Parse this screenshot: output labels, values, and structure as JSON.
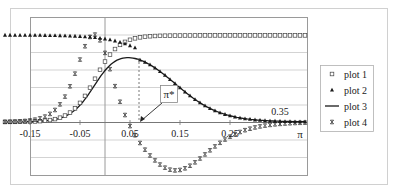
{
  "chart_data": {
    "type": "scatter",
    "title": "",
    "xlabel": "π",
    "ylabel": "",
    "xlim": [
      -0.2,
      0.4
    ],
    "ylim": [
      -0.6,
      1.2
    ],
    "grid": {
      "horizontal": true,
      "vertical": false
    },
    "legend_position": "right",
    "x_tick_labels": [
      {
        "value": -0.15,
        "label": "-0.15"
      },
      {
        "value": -0.05,
        "label": "-0.05"
      },
      {
        "value": 0.05,
        "label": "0.05"
      },
      {
        "value": 0.15,
        "label": "0.15"
      },
      {
        "value": 0.25,
        "label": "0.25"
      },
      {
        "value": 0.35,
        "label": "0.35"
      }
    ],
    "axis_end_label": "π",
    "annotation": {
      "label": "π*",
      "x": 0.068,
      "y": 0.0,
      "dashed_line_top_y": 0.74
    },
    "series": [
      {
        "name": "plot 1",
        "marker": "square-open",
        "description": "logistic rising from 0 (~-0.2) to 1 (~0.1), flat at 1 thereafter",
        "x": [
          -0.2,
          -0.15,
          -0.1,
          -0.05,
          0,
          0.02,
          0.04,
          0.06,
          0.08,
          0.1,
          0.15,
          0.2,
          0.3,
          0.4
        ],
        "values": [
          0.0,
          0.02,
          0.08,
          0.25,
          0.55,
          0.7,
          0.82,
          0.92,
          0.97,
          0.99,
          1.0,
          1.0,
          1.0,
          1.0
        ]
      },
      {
        "name": "plot 2",
        "marker": "triangle-filled",
        "description": "flat at 1 then declining to 0 near 0.4",
        "x": [
          -0.2,
          -0.1,
          0,
          0.04,
          0.07,
          0.1,
          0.15,
          0.2,
          0.25,
          0.3,
          0.35,
          0.4
        ],
        "values": [
          1.0,
          0.99,
          0.95,
          0.86,
          0.74,
          0.64,
          0.45,
          0.26,
          0.12,
          0.05,
          0.02,
          0.01
        ]
      },
      {
        "name": "plot 3",
        "marker": "line",
        "description": "bell curve peaking ~0.74 at π*≈0.068",
        "x": [
          -0.2,
          -0.15,
          -0.1,
          -0.05,
          0,
          0.03,
          0.068,
          0.1,
          0.15,
          0.2,
          0.25,
          0.3,
          0.35,
          0.4
        ],
        "values": [
          0.0,
          0.02,
          0.07,
          0.24,
          0.52,
          0.66,
          0.74,
          0.64,
          0.45,
          0.26,
          0.12,
          0.05,
          0.02,
          0.01
        ]
      },
      {
        "name": "plot 4",
        "marker": "x",
        "description": "difference curve: rises to ~0.8 near 0, crosses 0 at π*, min ~-0.39 near 0.17, returns toward 0",
        "x": [
          -0.2,
          -0.15,
          -0.1,
          -0.05,
          -0.02,
          0,
          0.03,
          0.05,
          0.068,
          0.1,
          0.13,
          0.17,
          0.2,
          0.25,
          0.3,
          0.35,
          0.4
        ],
        "values": [
          0.0,
          0.05,
          0.2,
          0.6,
          0.78,
          0.8,
          0.6,
          0.3,
          0.0,
          -0.25,
          -0.36,
          -0.39,
          -0.37,
          -0.28,
          -0.18,
          -0.09,
          -0.03
        ]
      }
    ]
  },
  "legend": {
    "items": [
      {
        "label": "plot 1",
        "marker": "square-open"
      },
      {
        "label": "plot 2",
        "marker": "triangle-filled"
      },
      {
        "label": "plot 3",
        "marker": "line"
      },
      {
        "label": "plot 4",
        "marker": "x"
      }
    ]
  },
  "colors": {
    "frame": "#d0d0d0",
    "plot_border": "#9a9a9a",
    "grid": "#c8c8c8",
    "series": "#1a1a1a",
    "open_marker": "#444444"
  }
}
